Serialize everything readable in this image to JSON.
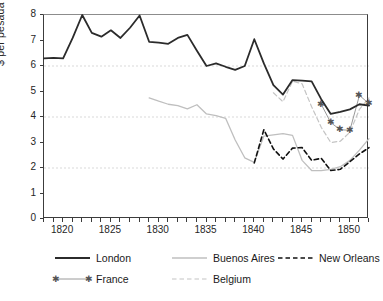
{
  "chart_data": {
    "type": "line",
    "title": "",
    "xlabel": "",
    "ylabel": "$ per pesada (35 lb)",
    "xlim": [
      1818,
      1852
    ],
    "ylim": [
      0,
      8
    ],
    "xticks": [
      1820,
      1825,
      1830,
      1835,
      1840,
      1845,
      1850
    ],
    "xtick_labels": [
      "1820",
      "1825",
      "1830",
      "1835",
      "1840",
      "1845",
      "1850"
    ],
    "minor_xtick_step": 1,
    "yticks": [
      0,
      1,
      2,
      3,
      4,
      5,
      6,
      7,
      8
    ],
    "ytick_labels": [
      "0",
      "1",
      "2",
      "3",
      "4",
      "5",
      "6",
      "7",
      "8"
    ],
    "gridlines": {
      "y": [
        2,
        4,
        6
      ],
      "style": "dashed",
      "color": "#d9d9d9"
    },
    "legend_position": "below",
    "series": [
      {
        "name": "London",
        "color": "#2b2b2b",
        "style": "solid",
        "width": 1.8,
        "marker": "none",
        "x": [
          1818,
          1819,
          1820,
          1821,
          1822,
          1823,
          1824,
          1825,
          1826,
          1827,
          1828,
          1829,
          1830,
          1831,
          1832,
          1833,
          1834,
          1835,
          1836,
          1837,
          1838,
          1839,
          1840,
          1841,
          1842,
          1843,
          1844,
          1845,
          1846,
          1847,
          1848,
          1849,
          1850,
          1851,
          1852
        ],
        "y": [
          6.3,
          6.32,
          6.3,
          7.1,
          8.0,
          7.3,
          7.15,
          7.4,
          7.1,
          7.5,
          7.98,
          6.95,
          6.92,
          6.87,
          7.1,
          7.22,
          6.6,
          6.0,
          6.1,
          5.97,
          5.85,
          6.0,
          7.05,
          6.1,
          5.25,
          4.88,
          5.45,
          5.43,
          5.4,
          4.7,
          4.12,
          4.2,
          4.3,
          4.5,
          4.45
        ]
      },
      {
        "name": "Buenos Aires",
        "color": "#bfbfbf",
        "style": "solid",
        "width": 1.3,
        "marker": "none",
        "x": [
          1829,
          1830,
          1831,
          1832,
          1833,
          1834,
          1835,
          1836,
          1837,
          1838,
          1839,
          1840,
          1841,
          1842,
          1843,
          1844,
          1845,
          1846,
          1847,
          1848,
          1849,
          1850,
          1851,
          1852
        ],
        "y": [
          4.75,
          4.62,
          4.5,
          4.45,
          4.32,
          4.48,
          4.12,
          4.05,
          3.95,
          3.1,
          2.4,
          2.22,
          3.25,
          3.3,
          3.35,
          3.28,
          2.3,
          1.9,
          1.9,
          1.95,
          2.05,
          2.3,
          2.7,
          3.15
        ]
      },
      {
        "name": "New Orleans",
        "color": "#111111",
        "style": "dashed",
        "width": 1.6,
        "marker": "none",
        "x": [
          1840,
          1841,
          1842,
          1843,
          1844,
          1845,
          1846,
          1847,
          1848,
          1849,
          1850,
          1851,
          1852
        ],
        "y": [
          2.2,
          3.5,
          2.75,
          2.35,
          2.78,
          2.8,
          2.3,
          2.38,
          1.9,
          1.95,
          2.25,
          2.55,
          2.8
        ]
      },
      {
        "name": "France",
        "color": "#9a9a9a",
        "style": "solid",
        "width": 1.0,
        "marker": "star",
        "marker_color": "#555555",
        "x": [
          1847,
          1848,
          1849,
          1850,
          1851,
          1852
        ],
        "y": [
          4.5,
          3.78,
          3.5,
          3.48,
          4.85,
          4.52
        ]
      },
      {
        "name": "Belgium",
        "color": "#c4c4c4",
        "style": "dashed",
        "width": 1.2,
        "marker": "none",
        "x": [
          1842,
          1843,
          1844,
          1845,
          1846,
          1847,
          1848,
          1849,
          1850,
          1851,
          1852
        ],
        "y": [
          4.95,
          4.6,
          5.4,
          5.3,
          4.4,
          3.6,
          3.0,
          3.05,
          3.4,
          4.3,
          4.75
        ]
      }
    ]
  },
  "legend": {
    "items": [
      {
        "label": "London"
      },
      {
        "label": "Buenos Aires"
      },
      {
        "label": "New Orleans"
      },
      {
        "label": "France"
      },
      {
        "label": "Belgium"
      }
    ]
  }
}
